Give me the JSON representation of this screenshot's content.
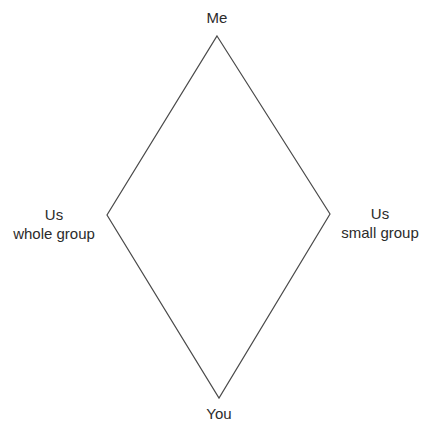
{
  "diagram": {
    "type": "diamond",
    "line_color": "#4a4a4a",
    "vertices": {
      "top": {
        "x": 217,
        "y": 36
      },
      "right": {
        "x": 330,
        "y": 214
      },
      "bottom": {
        "x": 219,
        "y": 398
      },
      "left": {
        "x": 107,
        "y": 215
      }
    },
    "labels": {
      "top": {
        "line1": "Me"
      },
      "left": {
        "line1": "Us",
        "line2": "whole group"
      },
      "right": {
        "line1": "Us",
        "line2": "small group"
      },
      "bottom": {
        "line1": "You"
      }
    }
  }
}
